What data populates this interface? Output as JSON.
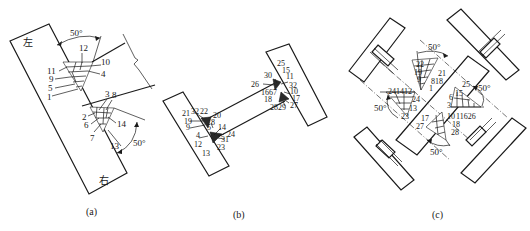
{
  "panels": [
    {
      "id": "a",
      "caption": "(a)",
      "plate_labels": {
        "top": "左",
        "bottom": "右"
      },
      "angles": [
        "50°",
        "50°"
      ],
      "upper_weld_passes": [
        "12",
        "10",
        "4",
        "11",
        "9",
        "5",
        "1"
      ],
      "lower_weld_passes": [
        "3",
        "8",
        "2",
        "6",
        "14",
        "7",
        "13"
      ]
    },
    {
      "id": "b",
      "caption": "(b)",
      "left_joint_passes": [
        "21",
        "32",
        "22",
        "20",
        "19",
        "8",
        "9",
        "5",
        "3",
        "14",
        "4",
        "24",
        "31",
        "12",
        "23",
        "13"
      ],
      "right_joint_passes": [
        "25",
        "30",
        "15",
        "11",
        "26",
        "32",
        "16",
        "6",
        "7",
        "10",
        "18",
        "17",
        "28",
        "29",
        "27"
      ]
    },
    {
      "id": "c",
      "caption": "(c)",
      "angles": [
        "50°",
        "50°",
        "50°",
        "50°"
      ],
      "upper_left_passes": [
        "22",
        "19",
        "9",
        "21",
        "8",
        "18",
        "1"
      ],
      "left_passes": [
        "24",
        "14",
        "12",
        "4",
        "24",
        "13",
        "23"
      ],
      "right_passes": [
        "25",
        "15",
        "6",
        "3",
        "11",
        "16",
        "26"
      ],
      "lower_passes": [
        "17",
        "27",
        "10",
        "18",
        "28"
      ]
    }
  ],
  "labels": {
    "a": {
      "l12": "12",
      "l10": "10",
      "l11": "11",
      "l4": "4",
      "l9": "9",
      "l5": "5",
      "l1": "1",
      "l3": "3",
      "l8": "8",
      "l2": "2",
      "l6": "6",
      "l14": "14",
      "l7": "7",
      "l13": "13",
      "ang1": "50°",
      "ang2": "50°",
      "zuo": "左",
      "you": "右",
      "cap": "(a)"
    },
    "b": {
      "l21": "21",
      "l32a": "32",
      "l22": "22",
      "l20": "20",
      "l19": "19",
      "l8": "8",
      "l9": "9",
      "l5": "5",
      "l14": "14",
      "l4": "4",
      "l24": "24",
      "l31": "31",
      "l12": "12",
      "l23": "23",
      "l13": "13",
      "l25": "25",
      "l30": "30",
      "l15": "15",
      "l11": "11",
      "l26": "26",
      "l32b": "32",
      "l1667": "1667",
      "l10": "10",
      "l18": "18",
      "l17": "17",
      "l2829": "2829",
      "l27": "27",
      "cap": "(b)"
    },
    "c": {
      "l22": "22",
      "l19": "19",
      "l9": "9",
      "l21": "21",
      "l818": "818",
      "l1": "1",
      "l2414": "2414",
      "l12": "12",
      "l24": "24",
      "l13": "13",
      "l23": "23",
      "l25": "25",
      "l15": "15",
      "l6": "6",
      "l3": "3",
      "l11626": "11626",
      "l17": "17",
      "l27": "27",
      "l10": "10",
      "l18": "18",
      "l28": "28",
      "ang_top": "50°",
      "ang_left": "50°",
      "ang_right": "50°",
      "ang_bottom": "50°",
      "cap": "(c)"
    }
  }
}
